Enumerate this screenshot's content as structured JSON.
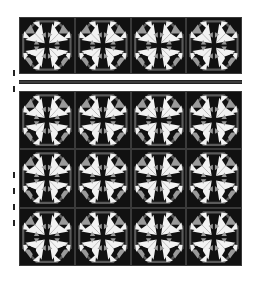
{
  "image": {
    "subject": "quilt block pattern",
    "layout": {
      "top_rows": 1,
      "main_rows": 3,
      "columns": 4,
      "separator": "horizontal dark strip between first row and remaining rows"
    },
    "colors": {
      "background": "#ffffff",
      "tile_dark": "#111111",
      "octagon_gray": "#5a5a5a",
      "triangle_light": "#f2f2f2",
      "triangle_mid": "#9a9a9a",
      "strip": "#3c3c3c"
    },
    "left_ticks": [
      70,
      86,
      172,
      188,
      204,
      220
    ]
  }
}
